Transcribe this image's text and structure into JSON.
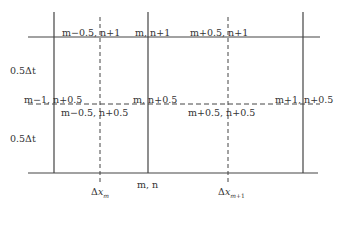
{
  "diagram": {
    "type": "staggered finite-difference grid (space-time)",
    "colors": {
      "line": "#444444",
      "text": "#333333",
      "background": "#ffffff"
    },
    "grid": {
      "solid_vertical_x": [
        54,
        148,
        303
      ],
      "dashed_vertical_x": [
        100,
        228
      ],
      "top_line_y": 37,
      "bottom_line_y": 173,
      "dashed_horizontal_y": 104
    },
    "node_labels": {
      "top_left_half": "m−0.5, n+1",
      "top_center": "m, n+1",
      "top_right_half": "m+0.5, n+1",
      "mid_left": "m−1, n+0.5",
      "mid_center": "m, n+0.5",
      "mid_right": "m+1, n+0.5",
      "mid_left_half": "m−0.5, n+0.5",
      "mid_right_half": "m+0.5, n+0.5",
      "bottom_center": "m, n"
    },
    "time_step_labels": [
      "0.5Δt",
      "0.5Δt"
    ],
    "space_step_labels": [
      "Δx_m",
      "Δx_m+1"
    ]
  }
}
